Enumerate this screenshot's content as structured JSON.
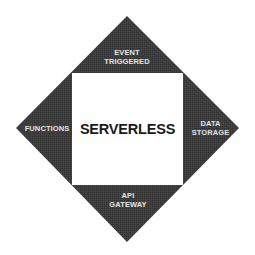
{
  "diagram": {
    "title": "SERVERLESS",
    "colors": {
      "diamond": "#3b3b3b",
      "center_fill": "#ffffff",
      "label_text": "#e4e4e4",
      "title_text": "#1a1a1a"
    },
    "sections": {
      "top": {
        "line1": "EVENT",
        "line2": "TRIGGERED"
      },
      "left": {
        "line1": "FUNCTIONS"
      },
      "right": {
        "line1": "DATA",
        "line2": "STORAGE"
      },
      "bottom": {
        "line1": "API",
        "line2": "GATEWAY"
      }
    }
  }
}
